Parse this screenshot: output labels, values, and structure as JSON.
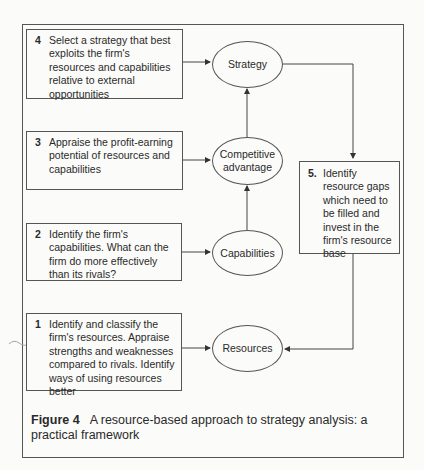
{
  "steps": [
    {
      "num": "1",
      "text": "Identify and classify the firm's resources. Appraise strengths and weaknesses compared to rivals. Identify ways of using resources better"
    },
    {
      "num": "2",
      "text": "Identify the firm's capabilities. What can the firm do more effectively than its rivals?"
    },
    {
      "num": "3",
      "text": "Appraise the profit-earning potential of resources and capabilities"
    },
    {
      "num": "4",
      "text": "Select a strategy that best exploits the firm's resources and capabilities relative to external opportunities"
    },
    {
      "num": "5.",
      "text": "Identify resource gaps which need to be filled and invest in the firm's resource base"
    }
  ],
  "nodes": {
    "strategy": "Strategy",
    "competitive_advantage": "Competitive advantage",
    "capabilities": "Capabilities",
    "resources": "Resources"
  },
  "caption": {
    "label": "Figure 4",
    "text": "A resource-based approach to strategy analysis: a practical framework"
  }
}
